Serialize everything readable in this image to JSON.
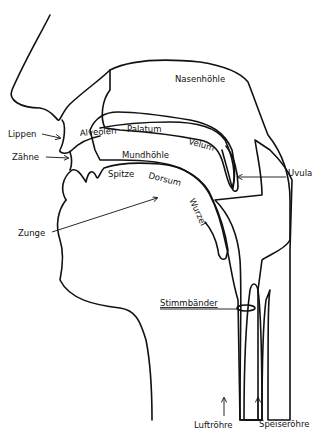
{
  "diagram": {
    "title": "",
    "labels": {
      "nasal_cavity": "Nasenhöhle",
      "lips": "Lippen",
      "teeth": "Zähne",
      "alveoli": "Alveolen",
      "palate": "Palatum",
      "velum": "Velum",
      "oral_cavity": "Mundhöhle",
      "uvula": "Uvula",
      "tongue_tip": "Spitze",
      "tongue_dorsum": "Dorsum",
      "tongue_root": "Wurzel",
      "tongue": "Zunge",
      "vocal_folds": "Stimmbänder",
      "trachea": "Luftröhre",
      "esophagus": "Speiseröhre"
    }
  }
}
